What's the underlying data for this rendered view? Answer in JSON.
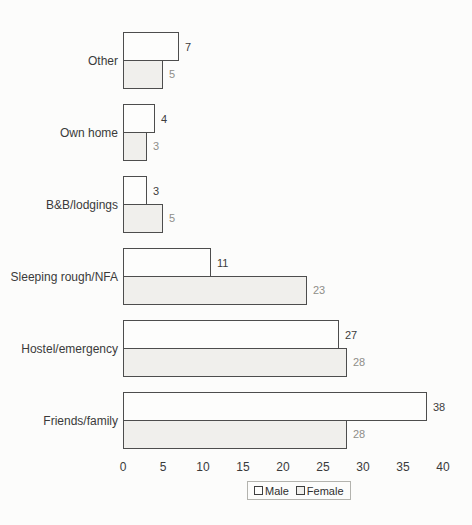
{
  "chart_data": {
    "type": "bar",
    "orientation": "horizontal",
    "title": "",
    "xlabel": "",
    "ylabel": "",
    "categories": [
      "Other",
      "Own home",
      "B&B/lodgings",
      "Sleeping rough/NFA",
      "Hostel/emergency",
      "Friends/family"
    ],
    "series": [
      {
        "name": "Male",
        "values": [
          7,
          4,
          3,
          11,
          27,
          38
        ],
        "fill": "#fdfdfc",
        "label_color": "#3d3d3d"
      },
      {
        "name": "Female",
        "values": [
          5,
          3,
          5,
          23,
          28,
          28
        ],
        "fill": "#f0efec",
        "label_color": "#8e8e89"
      }
    ],
    "x_ticks": [
      0,
      5,
      10,
      15,
      20,
      25,
      30,
      35,
      40
    ],
    "xlim": [
      0,
      40
    ],
    "grid": false,
    "axis_lines": false,
    "data_labels": true,
    "bar_border_color": "#4d4d4d",
    "legend": {
      "position": "bottom-center",
      "entries": [
        "Male",
        "Female"
      ]
    }
  }
}
